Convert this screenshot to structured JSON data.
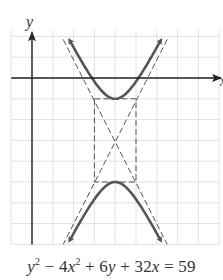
{
  "axes": {
    "x_label": "x",
    "y_label": "y",
    "unit_px": 20.8,
    "origin_px": [
      32,
      78
    ],
    "x_range": [
      -1,
      9
    ],
    "y_range": [
      -8,
      2
    ]
  },
  "equation": {
    "text": "y^2 − 4x^2 + 6y + 32x = 59",
    "parts": [
      "y",
      "2",
      " − 4",
      "x",
      "2",
      " + 6",
      "y",
      " + 32",
      "x",
      " = 59"
    ]
  },
  "hyperbola": {
    "standard_form": "(y+3)^2/4 − (x−4)^2 = 1",
    "center": [
      4,
      -3
    ],
    "a": 2,
    "b": 1,
    "orientation": "vertical",
    "vertices": [
      [
        4,
        -1
      ],
      [
        4,
        -5
      ]
    ],
    "asymptote_slopes": [
      2,
      -2
    ]
  },
  "fundamental_rectangle": {
    "x": [
      3,
      5
    ],
    "y": [
      -5,
      -1
    ]
  },
  "colors": {
    "grid": "#d9d9d9",
    "axis": "#222222",
    "curve": "#555555",
    "dashed": "#555555",
    "text": "#333333"
  }
}
